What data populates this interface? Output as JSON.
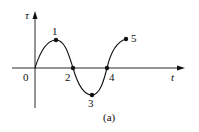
{
  "figure": {
    "caption": "(a)",
    "axes": {
      "y_label": "τ",
      "x_label": "t",
      "origin_label": "0"
    },
    "points": [
      {
        "label": "1",
        "x": 56,
        "y": 40
      },
      {
        "label": "2",
        "x": 73,
        "y": 68
      },
      {
        "label": "3",
        "x": 92,
        "y": 95
      },
      {
        "label": "4",
        "x": 107,
        "y": 68
      },
      {
        "label": "5",
        "x": 126,
        "y": 39
      }
    ],
    "colors": {
      "ink": "#111111",
      "background": "#ffffff"
    }
  }
}
